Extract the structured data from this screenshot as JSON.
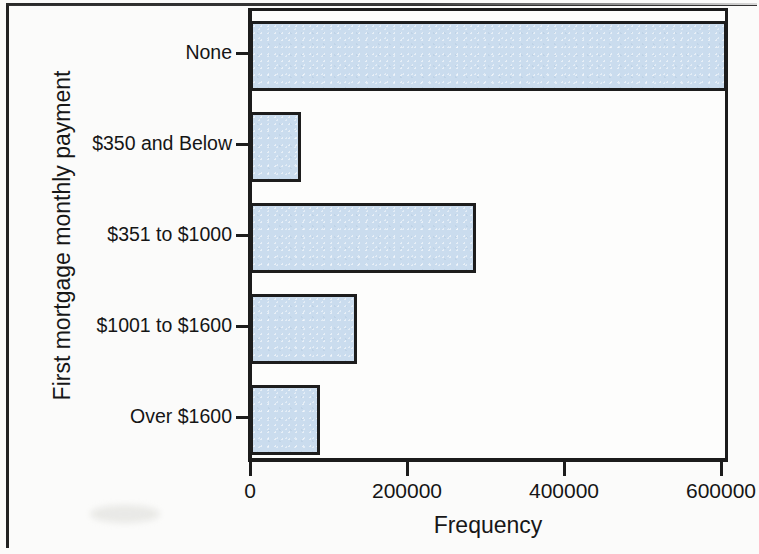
{
  "chart_data": {
    "type": "bar",
    "orientation": "horizontal",
    "title": "",
    "xlabel": "Frequency",
    "ylabel": "First mortgage monthly payment",
    "categories": [
      "None",
      "$350 and Below",
      "$351 to $1000",
      "$1001 to $1600",
      "Over $1600"
    ],
    "values": [
      602000,
      60000,
      283000,
      131000,
      84000
    ],
    "xlim": [
      0,
      620000
    ],
    "xticks": [
      0,
      200000,
      400000,
      600000
    ],
    "xticklabels": [
      "0",
      "200000",
      "400000",
      "600000"
    ],
    "grid": false,
    "legend": null,
    "bar_fill_color": "#cadcee",
    "bar_edge_color": "#1d1d1d",
    "axis_color": "#1c1c1c",
    "background_color": "#fbfbfa"
  },
  "axes": {
    "y_title": "First mortgage monthly payment",
    "x_title": "Frequency"
  }
}
